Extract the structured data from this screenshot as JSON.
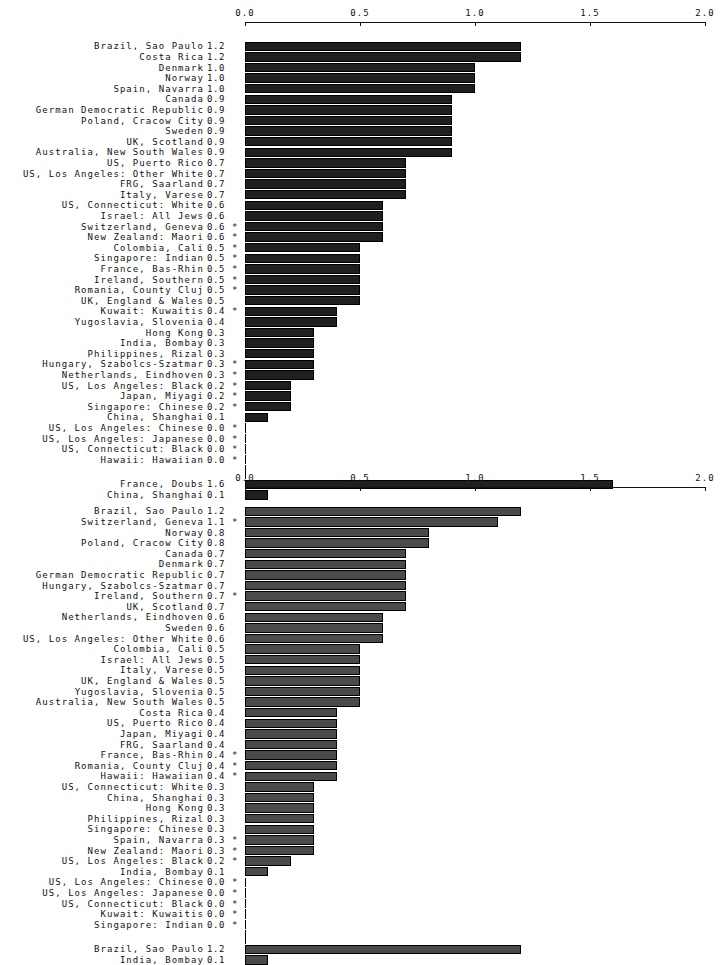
{
  "chart_data": [
    {
      "type": "bar",
      "orientation": "horizontal",
      "title": "",
      "xlabel": "",
      "ylabel": "",
      "xlim": [
        0.0,
        2.0
      ],
      "ticks": [
        "0.0",
        "0.5",
        "1.0",
        "1.5",
        "2.0"
      ],
      "tick_values": [
        0.0,
        0.5,
        1.0,
        1.5,
        2.0
      ],
      "grid": false,
      "bar_color": "#1f1f1f",
      "categories": [
        "Brazil, Sao Paulo",
        "Costa Rica",
        "Denmark",
        "Norway",
        "Spain, Navarra",
        "Canada",
        "German Democratic Republic",
        "Poland, Cracow City",
        "Sweden",
        "UK, Scotland",
        "Australia, New South Wales",
        "US, Puerto Rico",
        "US, Los Angeles: Other White",
        "FRG, Saarland",
        "Italy, Varese",
        "US, Connecticut: White",
        "Israel: All Jews",
        "Switzerland, Geneva",
        "New Zealand: Maori",
        "Colombia, Cali",
        "Singapore: Indian",
        "France, Bas-Rhin",
        "Ireland, Southern",
        "Romania, County Cluj",
        "UK, England & Wales",
        "Kuwait: Kuwaitis",
        "Yugoslavia, Slovenia",
        "Hong Kong",
        "India, Bombay",
        "Philippines, Rizal",
        "Hungary, Szabolcs-Szatmar",
        "Netherlands, Eindhoven",
        "US, Los Angeles: Black",
        "Japan, Miyagi",
        "Singapore: Chinese",
        "China, Shanghai",
        "US, Los Angeles: Chinese",
        "US, Los Angeles: Japanese",
        "US, Connecticut: Black",
        "Hawaii: Hawaiian"
      ],
      "values": [
        1.2,
        1.2,
        1.0,
        1.0,
        1.0,
        0.9,
        0.9,
        0.9,
        0.9,
        0.9,
        0.9,
        0.7,
        0.7,
        0.7,
        0.7,
        0.6,
        0.6,
        0.6,
        0.6,
        0.5,
        0.5,
        0.5,
        0.5,
        0.5,
        0.5,
        0.4,
        0.4,
        0.3,
        0.3,
        0.3,
        0.3,
        0.3,
        0.2,
        0.2,
        0.2,
        0.1,
        0.0,
        0.0,
        0.0,
        0.0
      ],
      "value_labels": [
        "1.2",
        "1.2",
        "1.0",
        "1.0",
        "1.0",
        "0.9",
        "0.9",
        "0.9",
        "0.9",
        "0.9",
        "0.9",
        "0.7",
        "0.7",
        "0.7",
        "0.7",
        "0.6",
        "0.6",
        "0.6",
        "0.6",
        "0.5",
        "0.5",
        "0.5",
        "0.5",
        "0.5",
        "0.5",
        "0.4",
        "0.4",
        "0.3",
        "0.3",
        "0.3",
        "0.3",
        "0.3",
        "0.2",
        "0.2",
        "0.2",
        "0.1",
        "0.0",
        "0.0",
        "0.0",
        "0.0"
      ],
      "flags": [
        "",
        "",
        "",
        "",
        "",
        "",
        "",
        "",
        "",
        "",
        "",
        "",
        "",
        "",
        "",
        "",
        "",
        "*",
        "*",
        "*",
        "*",
        "*",
        "*",
        "*",
        "",
        "*",
        "",
        "",
        "",
        "",
        "*",
        "*",
        "*",
        "*",
        "*",
        "",
        "*",
        "*",
        "*",
        "*"
      ],
      "extra_categories": [
        "France, Doubs",
        "China, Shanghai"
      ],
      "extra_values": [
        1.6,
        0.1
      ],
      "extra_value_labels": [
        "1.6",
        "0.1"
      ],
      "extra_flags": [
        "",
        ""
      ]
    },
    {
      "type": "bar",
      "orientation": "horizontal",
      "title": "",
      "xlabel": "",
      "ylabel": "",
      "xlim": [
        0.0,
        2.0
      ],
      "ticks": [
        "0.0",
        "0.5",
        "1.0",
        "1.5",
        "2.0"
      ],
      "tick_values": [
        0.0,
        0.5,
        1.0,
        1.5,
        2.0
      ],
      "grid": false,
      "bar_color": "#4a4a4a",
      "categories": [
        "Brazil, Sao Paulo",
        "Switzerland, Geneva",
        "Norway",
        "Poland, Cracow City",
        "Canada",
        "Denmark",
        "German Democratic Republic",
        "Hungary, Szabolcs-Szatmar",
        "Ireland, Southern",
        "UK, Scotland",
        "Netherlands, Eindhoven",
        "Sweden",
        "US, Los Angeles: Other White",
        "Colombia, Cali",
        "Israel: All Jews",
        "Italy, Varese",
        "UK, England & Wales",
        "Yugoslavia, Slovenia",
        "Australia, New South Wales",
        "Costa Rica",
        "US, Puerto Rico",
        "Japan, Miyagi",
        "FRG, Saarland",
        "France, Bas-Rhin",
        "Romania, County Cluj",
        "Hawaii: Hawaiian",
        "US, Connecticut: White",
        "China, Shanghai",
        "Hong Kong",
        "Philippines, Rizal",
        "Singapore: Chinese",
        "Spain, Navarra",
        "New Zealand: Maori",
        "US, Los Angeles: Black",
        "India, Bombay",
        "US, Los Angeles: Chinese",
        "US, Los Angeles: Japanese",
        "US, Connecticut: Black",
        "Kuwait: Kuwaitis",
        "Singapore: Indian"
      ],
      "values": [
        1.2,
        1.1,
        0.8,
        0.8,
        0.7,
        0.7,
        0.7,
        0.7,
        0.7,
        0.7,
        0.6,
        0.6,
        0.6,
        0.5,
        0.5,
        0.5,
        0.5,
        0.5,
        0.5,
        0.4,
        0.4,
        0.4,
        0.4,
        0.4,
        0.4,
        0.4,
        0.3,
        0.3,
        0.3,
        0.3,
        0.3,
        0.3,
        0.3,
        0.2,
        0.1,
        0.0,
        0.0,
        0.0,
        0.0,
        0.0
      ],
      "value_labels": [
        "1.2",
        "1.1",
        "0.8",
        "0.8",
        "0.7",
        "0.7",
        "0.7",
        "0.7",
        "0.7",
        "0.7",
        "0.6",
        "0.6",
        "0.6",
        "0.5",
        "0.5",
        "0.5",
        "0.5",
        "0.5",
        "0.5",
        "0.4",
        "0.4",
        "0.4",
        "0.4",
        "0.4",
        "0.4",
        "0.4",
        "0.3",
        "0.3",
        "0.3",
        "0.3",
        "0.3",
        "0.3",
        "0.3",
        "0.2",
        "0.1",
        "0.0",
        "0.0",
        "0.0",
        "0.0",
        "0.0"
      ],
      "flags": [
        "",
        "*",
        "",
        "",
        "",
        "",
        "",
        "",
        "*",
        "",
        "",
        "",
        "",
        "",
        "",
        "",
        "",
        "",
        "",
        "",
        "",
        "",
        "",
        "*",
        "*",
        "*",
        "",
        "",
        "",
        "",
        "",
        "*",
        "*",
        "*",
        "",
        "*",
        "*",
        "*",
        "*",
        "*"
      ],
      "extra_categories": [
        "Brazil, Sao Paulo",
        "India, Bombay"
      ],
      "extra_values": [
        1.2,
        0.1
      ],
      "extra_value_labels": [
        "1.2",
        "0.1"
      ],
      "extra_flags": [
        "",
        ""
      ]
    }
  ]
}
